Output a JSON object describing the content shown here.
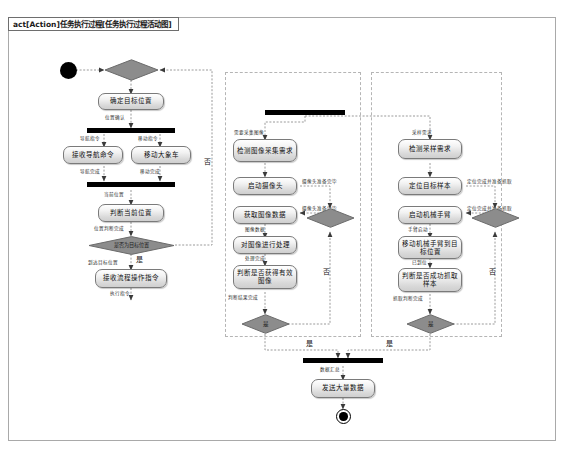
{
  "frame": {
    "label": "act[Action]任务执行过程[任务执行过程活动图]"
  },
  "colors": {
    "diamond_fill": "#8c8c8c",
    "diamond_stroke": "#6b6b6b",
    "bar_fill": "#000000",
    "node_border": "#7a7a7a",
    "edge": "#8a8a8a",
    "region_border": "#b5b5b5",
    "frame_border": "#a9a9a9"
  },
  "nodes": {
    "start": "initial-node",
    "d_top": "决策节点",
    "a_confirm_target": "确定目标位置",
    "fork_left": "fork-bar",
    "a_recv_nav": "接收导航命令",
    "a_move_car": "移动大象车",
    "join_left": "join-bar",
    "a_judge_cur": "判断当前位置",
    "d_is_target": "是否为目标位置",
    "a_recv_proc": "接收流程操作指令",
    "fork_mid_top": "fork-bar",
    "a_detect_need": "检测图像采集需求",
    "a_start_cam": "启动摄像头",
    "a_get_img": "获取图像数据",
    "a_proc_img": "对图像进行处理",
    "a_judge_img": "判断是否获得有效图像",
    "d_mid_right": "决策节点",
    "d_mid_bottom": "是",
    "a_detect_sample": "检测采样需求",
    "a_locate_sample": "定位目标样本",
    "a_start_arm": "启动机械手臂",
    "a_move_arm": "移动机械手臂到目标位置",
    "a_judge_sample": "判断是否成功抓取样本",
    "d_right_top": "决策节点",
    "d_right_bottom": "是",
    "join_bottom": "join-bar",
    "a_send_data": "发送大量数据",
    "end": "final-node"
  },
  "edge_labels": {
    "start_to_d": "",
    "d_to_confirm": "开始任务",
    "confirm_to_fork": "位置确认",
    "fork_to_recv_nav": "导航指令",
    "fork_to_move_car": "移动指令",
    "recv_nav_to_join": "导航完成",
    "move_car_to_join": "移动完成",
    "join_to_judge": "当前位置",
    "judge_to_decision": "位置判断完成",
    "decision_no": "否",
    "decision_yes": "是",
    "decision_to_recv_proc": "到达目标位置",
    "recv_proc_out": "执行指令",
    "fork_mid_to_detect": "需要采集图像",
    "detect_to_startcam": "采集需求",
    "startcam_to_d": "摄像头准备完毕",
    "d_to_getimg": "摄像头准备完毕",
    "getimg_to_proc": "图像数据",
    "proc_to_judge": "处理完成",
    "judge_to_d_mid": "判断结果完成",
    "mid_no": "否",
    "mid_yes": "是",
    "fork_right_to_detect": "采样需求",
    "detect_to_locate": "采样需求",
    "locate_to_d": "定位完成并准备抓取",
    "d_to_startarm": "定位完成并准备抓取",
    "startarm_to_move": "手臂启动",
    "move_to_judge": "已到位",
    "judge_to_d_right": "抓取判断完成",
    "right_no": "否",
    "right_yes": "是",
    "join_to_send": "数据汇总",
    "send_to_end": ""
  }
}
